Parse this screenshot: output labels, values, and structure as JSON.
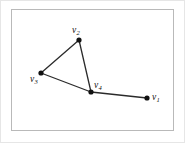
{
  "figure": {
    "kind": "graph-diagram",
    "background_color": "#ffffff",
    "frame_color": "#b9b9b9",
    "outer_border_color": "#e6e6e6",
    "edge_color": "#2b2b2b",
    "vertex_color": "#111111",
    "label_color": "#111111",
    "vertices": [
      {
        "id": "v1",
        "letter": "v",
        "subscript": "1",
        "x": 147,
        "y": 98,
        "radius": 2.6,
        "label_position": "right"
      },
      {
        "id": "v2",
        "letter": "v",
        "subscript": "2",
        "x": 79,
        "y": 40,
        "radius": 2.6,
        "label_position": "above"
      },
      {
        "id": "v3",
        "letter": "v",
        "subscript": "3",
        "x": 41,
        "y": 73,
        "radius": 2.6,
        "label_position": "below-left"
      },
      {
        "id": "v4",
        "letter": "v",
        "subscript": "4",
        "x": 91,
        "y": 92,
        "radius": 2.6,
        "label_position": "above-right"
      }
    ],
    "edges": [
      {
        "from": "v3",
        "to": "v2"
      },
      {
        "from": "v2",
        "to": "v4"
      },
      {
        "from": "v3",
        "to": "v4"
      },
      {
        "from": "v4",
        "to": "v1"
      }
    ]
  }
}
